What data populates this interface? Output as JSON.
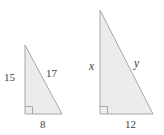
{
  "figure": {
    "background_color": "#ffffff",
    "fill_color": "#ececec",
    "stroke_color": "#a8a8a8",
    "label_color": "#3d3d3d"
  },
  "triangles": [
    {
      "name": "left-triangle",
      "vertices": {
        "apex": [
          25,
          45
        ],
        "right_angle": [
          25,
          114
        ],
        "base_end": [
          62,
          114
        ]
      },
      "labels": {
        "vertical_leg": "15",
        "hypotenuse": "17",
        "horizontal_leg": "8"
      },
      "right_angle_marker": true
    },
    {
      "name": "right-triangle",
      "vertices": {
        "apex": [
          100,
          10
        ],
        "right_angle": [
          100,
          114
        ],
        "base_end": [
          153,
          114
        ]
      },
      "labels": {
        "vertical_leg": "x",
        "hypotenuse": "y",
        "horizontal_leg": "12"
      },
      "right_angle_marker": true
    }
  ],
  "labels": {
    "left_vertical": "15",
    "left_hypotenuse": "17",
    "left_base": "8",
    "right_vertical": "x",
    "right_hypotenuse": "y",
    "right_base": "12"
  }
}
